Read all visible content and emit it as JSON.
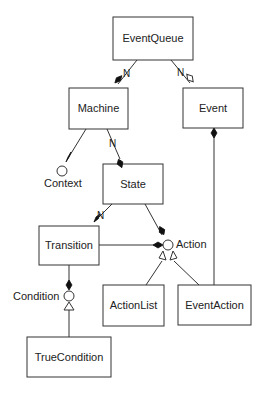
{
  "diagram": {
    "type": "UML class diagram",
    "classes": [
      {
        "id": "eventqueue",
        "label": "EventQueue"
      },
      {
        "id": "machine",
        "label": "Machine"
      },
      {
        "id": "event",
        "label": "Event"
      },
      {
        "id": "state",
        "label": "State"
      },
      {
        "id": "transition",
        "label": "Transition"
      },
      {
        "id": "actionlist",
        "label": "ActionList"
      },
      {
        "id": "eventaction",
        "label": "EventAction"
      },
      {
        "id": "truecondition",
        "label": "TrueCondition"
      }
    ],
    "interfaces": [
      {
        "id": "context",
        "label": "Context"
      },
      {
        "id": "action",
        "label": "Action"
      },
      {
        "id": "condition",
        "label": "Condition"
      }
    ],
    "multiplicities": {
      "eventqueue_machine": "N",
      "eventqueue_event": "N",
      "machine_state": "N",
      "state_transition": "N"
    },
    "relations": [
      {
        "from": "EventQueue",
        "to": "Machine",
        "kind": "composition",
        "multiplicity": "N"
      },
      {
        "from": "EventQueue",
        "to": "Event",
        "kind": "aggregation",
        "multiplicity": "N"
      },
      {
        "from": "Machine",
        "to": "Context",
        "kind": "composition"
      },
      {
        "from": "Machine",
        "to": "State",
        "kind": "composition",
        "multiplicity": "N"
      },
      {
        "from": "State",
        "to": "Transition",
        "kind": "composition",
        "multiplicity": "N"
      },
      {
        "from": "State",
        "to": "Action",
        "kind": "composition"
      },
      {
        "from": "Transition",
        "to": "Action",
        "kind": "composition"
      },
      {
        "from": "Transition",
        "to": "Condition",
        "kind": "composition"
      },
      {
        "from": "Event",
        "to": "EventAction",
        "kind": "composition"
      },
      {
        "from": "ActionList",
        "to": "Action",
        "kind": "realization"
      },
      {
        "from": "EventAction",
        "to": "Action",
        "kind": "realization"
      },
      {
        "from": "TrueCondition",
        "to": "Condition",
        "kind": "realization"
      }
    ]
  }
}
